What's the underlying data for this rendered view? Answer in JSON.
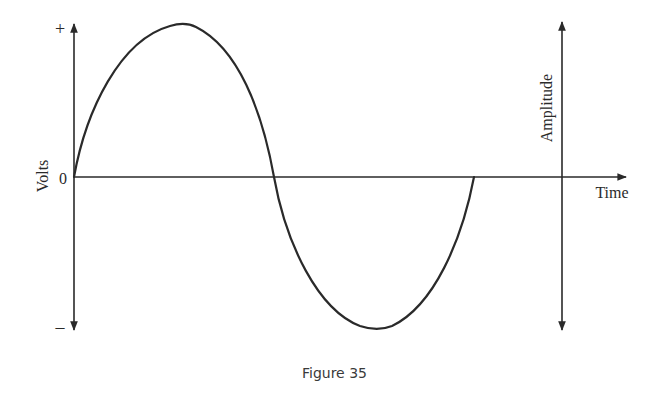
{
  "figure": {
    "caption": "Figure 35",
    "colors": {
      "stroke": "#2a2a2a",
      "background": "#ffffff"
    }
  },
  "left_axis": {
    "label": "Volts",
    "top_mark": "+",
    "zero_mark": "0",
    "bottom_mark": "–"
  },
  "right_axis": {
    "vertical_label": "Amplitude",
    "horizontal_label": "Time"
  },
  "waveform": {
    "type": "sine",
    "cycles": 1,
    "description": "One full cycle of an alternating voltage: rises from 0 to + peak, returns through 0, falls to – peak, returns to 0"
  }
}
